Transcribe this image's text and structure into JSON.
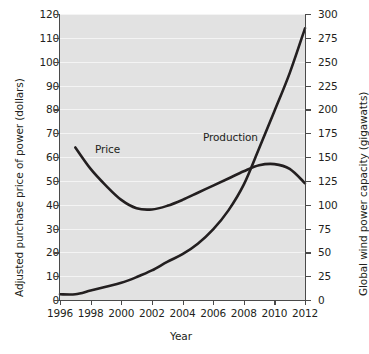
{
  "chart_data": {
    "type": "line",
    "title": "",
    "xlabel": "Year",
    "ylabel": "Adjusted purchase price of power (dollars)",
    "ylabel_right": "Global wind power capacity (gigawatts)",
    "xlim": [
      1996,
      2012
    ],
    "ylim": [
      0,
      120
    ],
    "ylim_right": [
      0,
      300
    ],
    "xticks": [
      "1996",
      "1998",
      "2000",
      "2002",
      "2004",
      "2006",
      "2008",
      "2010",
      "2012"
    ],
    "yticks_left": [
      "0",
      "10",
      "20",
      "30",
      "40",
      "50",
      "60",
      "70",
      "80",
      "90",
      "100",
      "110",
      "120"
    ],
    "yticks_right": [
      "0",
      "25",
      "50",
      "75",
      "100",
      "125",
      "150",
      "175",
      "200",
      "225",
      "250",
      "275",
      "300"
    ],
    "grid": "horizontal",
    "legend_position": "inline-annotations",
    "plot_background": "#e2e2e2",
    "line_color": "#231f20",
    "series": [
      {
        "name": "Price",
        "axis": "left",
        "units": "dollars",
        "label_text": "Price",
        "x": [
          1997,
          1998,
          1999,
          2000,
          2001,
          2002,
          2003,
          2004,
          2005,
          2006,
          2007,
          2008,
          2009,
          2010,
          2011,
          2012
        ],
        "values": [
          64,
          55,
          48,
          42,
          38.5,
          38,
          39.5,
          42,
          45,
          48,
          51,
          54,
          56.5,
          57,
          55,
          49
        ]
      },
      {
        "name": "Production",
        "axis": "right",
        "units": "gigawatts",
        "label_text": "Production",
        "x": [
          1996,
          1997,
          1998,
          1999,
          2000,
          2001,
          2002,
          2003,
          2004,
          2005,
          2006,
          2007,
          2008,
          2009,
          2010,
          2011,
          2012
        ],
        "values": [
          6,
          6,
          10,
          14,
          18,
          24,
          31,
          40,
          48,
          59,
          74,
          94,
          121,
          159,
          198,
          238,
          285
        ]
      }
    ]
  },
  "axes": {
    "x_title": "Year",
    "y_left_title": "Adjusted purchase price of power (dollars)",
    "y_right_title": "Global wind power capacity (gigawatts)"
  },
  "annotations": {
    "price_label": "Price",
    "production_label": "Production"
  }
}
